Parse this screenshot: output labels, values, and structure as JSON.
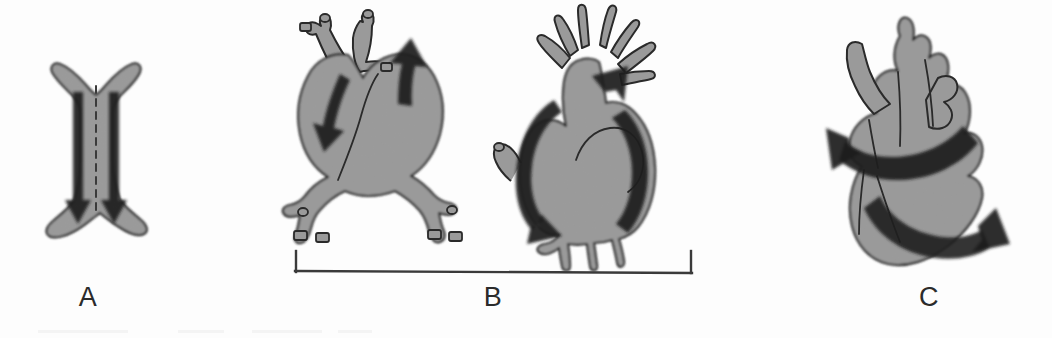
{
  "figure": {
    "kind": "cardiac-morphogenesis-diagram",
    "rendering": "grayscale scanned line drawing",
    "width": 1052,
    "height": 338,
    "background_color": "#fdfdfd",
    "tissue_fill_color": "#9a9a9a",
    "tissue_outline_color": "#2a2a2a",
    "arrow_color": "#1c1c1c",
    "label_color": "#2b2b2b",
    "bracket_color": "#3a3a3a"
  },
  "panels": [
    {
      "id": "a",
      "label": "A",
      "label_x": 88,
      "label_y": 300,
      "caption_text": "A",
      "description": "Bilaterally symmetric paired heart primordia with a dashed midline and two parallel arrows directed toward the midline fusion",
      "arrow_count": 2,
      "arrow_direction": "downward",
      "has_midline": true,
      "midline_style": "dashed"
    },
    {
      "id": "b",
      "label": "B",
      "label_x": 493,
      "label_y": 300,
      "caption_text": "B",
      "description": "Two looping heart tube stages spanned by a single bracket",
      "bracket": {
        "x_start": 295,
        "x_end": 692,
        "y_line": 272,
        "tick_height": 22
      },
      "sub_panels": [
        {
          "id": "b1",
          "description": "Early looped heart tube with two outflow vessels and splayed inflow vessels",
          "arrow_count": 2,
          "arrows": [
            "descending-left",
            "ascending-right"
          ]
        },
        {
          "id": "b2",
          "description": "Later looped heart with crown of pharyngeal arch arteries and bilateral curved arrows",
          "arrow_count": 2,
          "arrows": [
            "curved-left-sweep",
            "ascending-right"
          ],
          "arch_vessel_count": 7
        }
      ]
    },
    {
      "id": "c",
      "label": "C",
      "label_x": 928,
      "label_y": 300,
      "caption_text": "C",
      "description": "Mature four-chambered heart with two opposing broad curved torsion arrows",
      "arrow_count": 2,
      "arrows": [
        "upper-leftward-sweep",
        "lower-rightward-sweep"
      ]
    }
  ],
  "labels": {
    "a": "A",
    "b": "B",
    "c": "C"
  }
}
